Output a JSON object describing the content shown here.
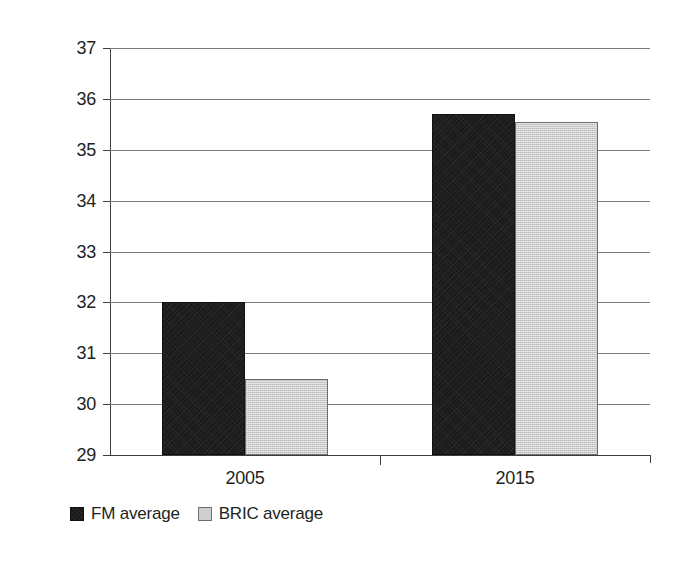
{
  "chart_data": {
    "type": "bar",
    "title": "",
    "subtitle": "",
    "xlabel": "",
    "ylabel": "",
    "categories": [
      "2005",
      "2015"
    ],
    "series": [
      {
        "name": "FM average",
        "values": [
          32.0,
          35.7
        ],
        "color": "#1a1a1a"
      },
      {
        "name": "BRIC average",
        "values": [
          30.5,
          35.55
        ],
        "color": "#cccccc"
      }
    ],
    "ylim": [
      29,
      37
    ],
    "y_ticks": [
      29,
      30,
      31,
      32,
      33,
      34,
      35,
      36,
      37
    ],
    "y_tick_labels": [
      "29",
      "30",
      "31",
      "32",
      "33",
      "34",
      "35",
      "36",
      "37"
    ],
    "grid": true,
    "grid_axis": "y",
    "legend_position": "bottom-left",
    "annotations": []
  },
  "legend": {
    "items": [
      {
        "label": "FM average",
        "swatch": "dark-square-swatch"
      },
      {
        "label": "BRIC average",
        "swatch": "light-square-swatch"
      }
    ]
  },
  "colors": {
    "series_fm": "#1a1a1a",
    "series_bric": "#cccccc",
    "gridline": "#7b7b7b",
    "axis": "#3d3d3d",
    "text": "#231f20",
    "background": "#ffffff"
  }
}
